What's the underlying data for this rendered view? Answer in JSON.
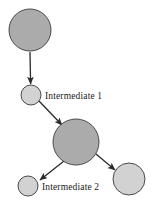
{
  "diagram": {
    "type": "node-link-graph",
    "background_color": "#ffffff",
    "canvas": {
      "width": 154,
      "height": 205
    },
    "style": {
      "node_fill_dark": "#ababab",
      "node_fill_light": "#d2d2d2",
      "node_stroke": "#4a4a4a",
      "node_stroke_width": 1,
      "edge_color": "#2a2a2a",
      "edge_width": 1.3,
      "label_color": "#1a1a1a",
      "label_font_size": 9.5
    },
    "nodes": [
      {
        "id": "source",
        "label": "",
        "cx": 30,
        "cy": 30,
        "r": 21,
        "fill": "#ababab",
        "size_class": "large"
      },
      {
        "id": "intermediate1",
        "label": "Intermediate 1",
        "label_x": 45,
        "label_y": 99,
        "cx": 31,
        "cy": 95,
        "r": 10,
        "fill": "#d2d2d2",
        "size_class": "small"
      },
      {
        "id": "hub",
        "label": "",
        "cx": 76,
        "cy": 142,
        "r": 23,
        "fill": "#ababab",
        "size_class": "large"
      },
      {
        "id": "intermediate2",
        "label": "Intermediate 2",
        "label_x": 42,
        "label_y": 190,
        "cx": 28,
        "cy": 186,
        "r": 10,
        "fill": "#d2d2d2",
        "size_class": "small"
      },
      {
        "id": "sink",
        "label": "",
        "cx": 129,
        "cy": 179,
        "r": 16,
        "fill": "#d2d2d2",
        "size_class": "medium"
      }
    ],
    "edges": [
      {
        "id": "edge-source-intermediate1",
        "from": "source",
        "to": "intermediate1",
        "x1": 30,
        "y1": 52,
        "x2": 30.6,
        "y2": 84,
        "arrow": true
      },
      {
        "id": "edge-intermediate1-hub",
        "from": "intermediate1",
        "to": "hub",
        "x1": 39,
        "y1": 101,
        "x2": 62,
        "y2": 125,
        "arrow": true
      },
      {
        "id": "edge-hub-intermediate2",
        "from": "hub",
        "to": "intermediate2",
        "x1": 64,
        "y1": 161,
        "x2": 40,
        "y2": 180,
        "arrow": true
      },
      {
        "id": "edge-hub-sink",
        "from": "hub",
        "to": "sink",
        "x1": 96,
        "y1": 154,
        "x2": 115,
        "y2": 170,
        "arrow": true
      }
    ],
    "labels": [
      {
        "id": "label-intermediate1",
        "text": "Intermediate 1",
        "x": 45,
        "y": 99
      },
      {
        "id": "label-intermediate2",
        "text": "Intermediate 2",
        "x": 42,
        "y": 190
      }
    ]
  }
}
